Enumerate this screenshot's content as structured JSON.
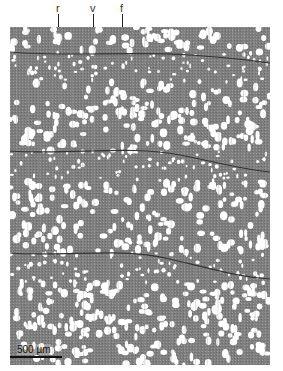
{
  "figure": {
    "labels": [
      {
        "text": "r",
        "meaning": "ray"
      },
      {
        "text": "v",
        "meaning": "vessel"
      },
      {
        "text": "f",
        "meaning": "fiber"
      }
    ],
    "scale_bar": {
      "text": "500 µm"
    },
    "colors": {
      "tissue": "#7a7a7a",
      "vessel_lumen": "#ffffff",
      "ring_boundary": "#333333"
    }
  }
}
